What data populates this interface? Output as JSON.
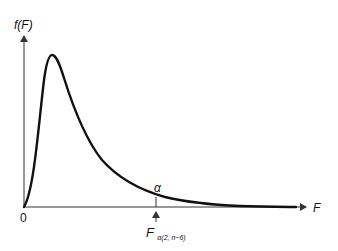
{
  "diagram": {
    "type": "f-distribution-density",
    "y_axis_label": "f(F)",
    "x_axis_label": "F",
    "origin_label": "0",
    "tail_area_label": "α",
    "critical_value": {
      "main": "F",
      "subscript": "α(2, n−6)"
    },
    "colors": {
      "curve": "#111111",
      "axes": "#333333",
      "background": "#ffffff"
    }
  }
}
